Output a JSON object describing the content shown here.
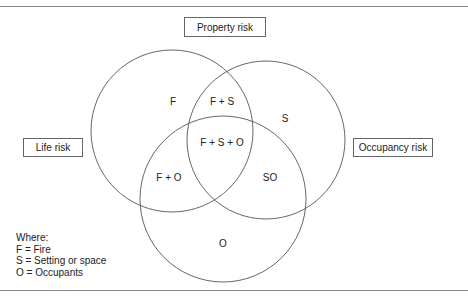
{
  "diagram": {
    "type": "venn",
    "sets": [
      {
        "key": "F",
        "name": "Fire",
        "outer_label": "Property risk"
      },
      {
        "key": "S",
        "name": "Setting or space",
        "outer_label": "Occupancy risk"
      },
      {
        "key": "O",
        "name": "Occupants",
        "outer_label": "Life risk"
      }
    ],
    "outer_labels": {
      "top": "Property risk",
      "left": "Life risk",
      "right": "Occupancy risk"
    },
    "regions": {
      "f": "F",
      "fs": "F + S",
      "s": "S",
      "fso": "F + S + O",
      "fo": "F + O",
      "so": "SO",
      "o": "O"
    },
    "legend": {
      "title": "Where:",
      "items": [
        "F = Fire",
        "S = Setting or space",
        "O = Occupants"
      ]
    },
    "colors": {
      "stroke": "#555555",
      "rule": "#8a8a8a",
      "text": "#222222"
    }
  }
}
